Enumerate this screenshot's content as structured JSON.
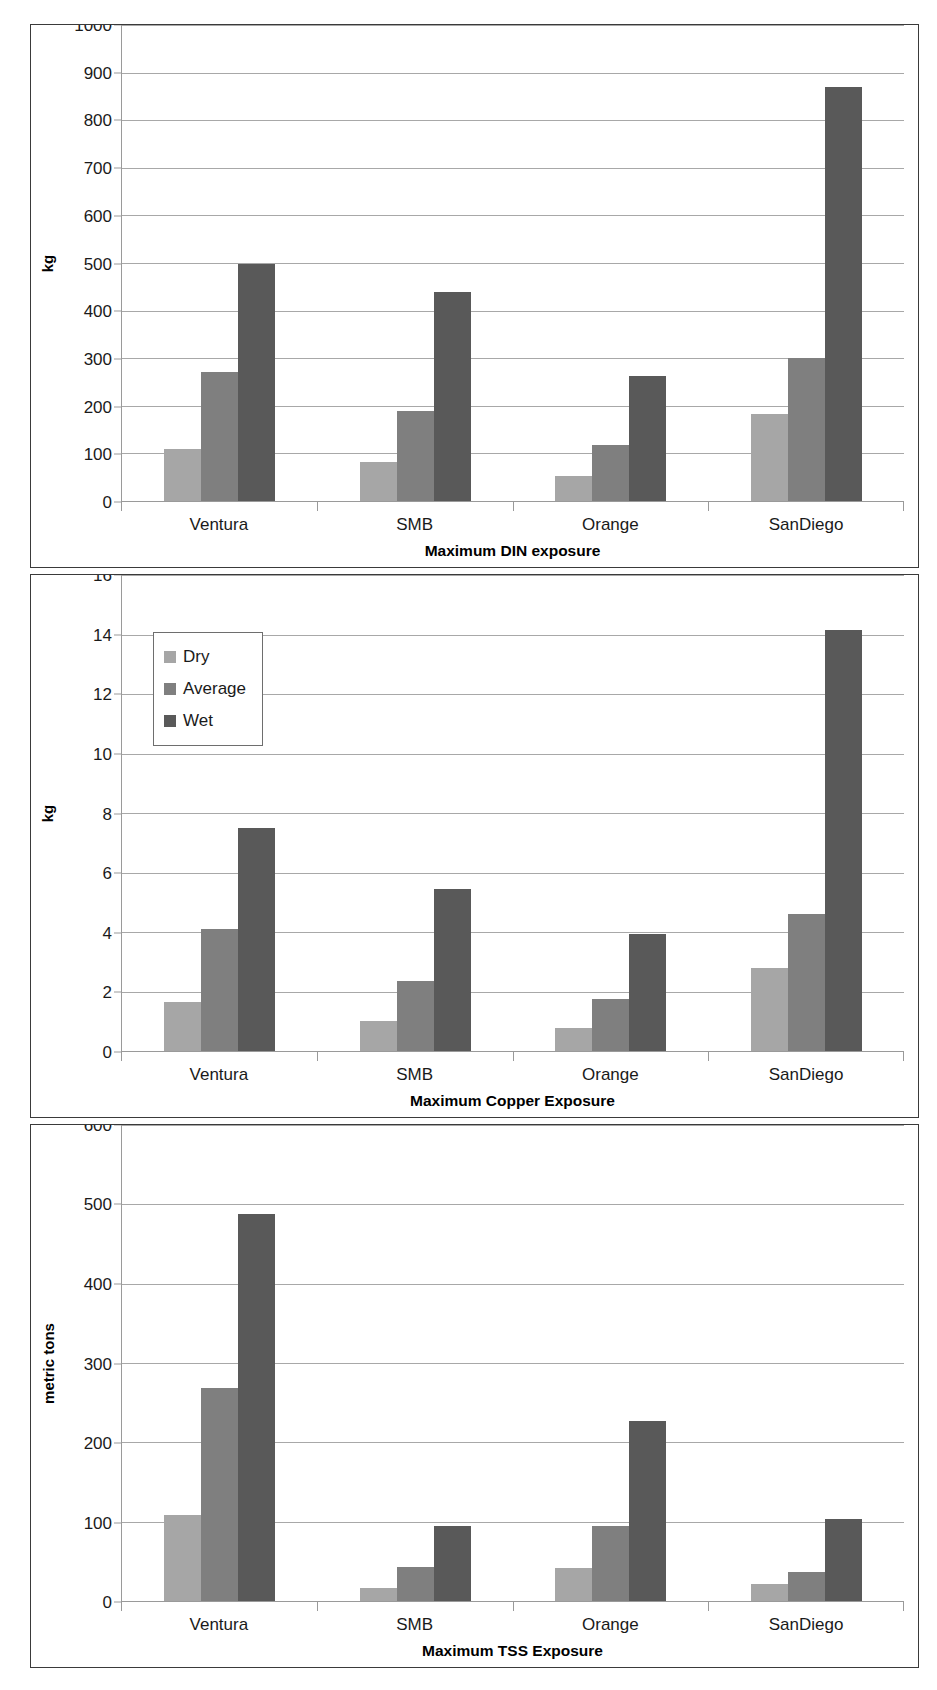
{
  "legend": {
    "items": [
      {
        "label": "Dry",
        "color": "#a6a6a6",
        "key": "dry"
      },
      {
        "label": "Average",
        "color": "#7f7f7f",
        "key": "average"
      },
      {
        "label": "Wet",
        "color": "#595959",
        "key": "wet"
      }
    ]
  },
  "chart_data": [
    {
      "type": "bar",
      "title": "",
      "xlabel": "Maximum DIN exposure",
      "ylabel": "kg",
      "ylim": [
        0,
        1000
      ],
      "yticks": [
        0,
        100,
        200,
        300,
        400,
        500,
        600,
        700,
        800,
        900,
        1000
      ],
      "ytick_labels": [
        "0",
        "100",
        "200",
        "300",
        "400",
        "500",
        "600",
        "700",
        "800",
        "900",
        "1000"
      ],
      "grid": true,
      "legend_position": "none",
      "categories": [
        "Ventura",
        "SMB",
        "Orange",
        "SanDiego"
      ],
      "series": [
        {
          "name": "Dry",
          "color": "#a6a6a6",
          "values": [
            110,
            82,
            53,
            183
          ]
        },
        {
          "name": "Average",
          "color": "#7f7f7f",
          "values": [
            272,
            190,
            117,
            300
          ]
        },
        {
          "name": "Wet",
          "color": "#595959",
          "values": [
            497,
            440,
            263,
            870
          ]
        }
      ]
    },
    {
      "type": "bar",
      "title": "",
      "xlabel": "Maximum Copper Exposure",
      "ylabel": "kg",
      "ylim": [
        0,
        16
      ],
      "yticks": [
        0,
        2,
        4,
        6,
        8,
        10,
        12,
        14,
        16
      ],
      "ytick_labels": [
        "0",
        "2",
        "4",
        "6",
        "8",
        "10",
        "12",
        "14",
        "16"
      ],
      "grid": true,
      "legend_position": "upper left",
      "categories": [
        "Ventura",
        "SMB",
        "Orange",
        "SanDiego"
      ],
      "series": [
        {
          "name": "Dry",
          "color": "#a6a6a6",
          "values": [
            1.65,
            1.0,
            0.78,
            2.8
          ]
        },
        {
          "name": "Average",
          "color": "#7f7f7f",
          "values": [
            4.1,
            2.35,
            1.75,
            4.6
          ]
        },
        {
          "name": "Wet",
          "color": "#595959",
          "values": [
            7.5,
            5.45,
            3.95,
            14.15
          ]
        }
      ]
    },
    {
      "type": "bar",
      "title": "",
      "xlabel": "Maximum TSS Exposure",
      "ylabel": "metric tons",
      "ylim": [
        0,
        600
      ],
      "yticks": [
        0,
        100,
        200,
        300,
        400,
        500,
        600
      ],
      "ytick_labels": [
        "0",
        "100",
        "200",
        "300",
        "400",
        "500",
        "600"
      ],
      "grid": true,
      "legend_position": "none",
      "categories": [
        "Ventura",
        "SMB",
        "Orange",
        "SanDiego"
      ],
      "series": [
        {
          "name": "Dry",
          "color": "#a6a6a6",
          "values": [
            108,
            17,
            41,
            22
          ]
        },
        {
          "name": "Average",
          "color": "#7f7f7f",
          "values": [
            268,
            43,
            95,
            37
          ]
        },
        {
          "name": "Wet",
          "color": "#595959",
          "values": [
            488,
            95,
            227,
            103
          ]
        }
      ]
    }
  ]
}
